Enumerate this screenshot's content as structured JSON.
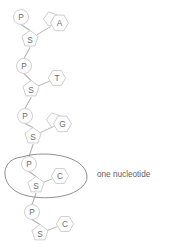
{
  "diagram": {
    "colors": {
      "background": "#ffffff",
      "shape_fill": "#fdfdfd",
      "shape_stroke": "#c9c9c9",
      "bond_stroke": "#b9b9b9",
      "backbone_stroke": "#b3b3b3",
      "outline_stroke": "#8f8f8f",
      "label_text": "#6f6f6f",
      "annotation_text": "#5f5f5f"
    },
    "annotation": {
      "text": "one nucleotide",
      "x": 97,
      "y": 174
    },
    "units": [
      {
        "index": 0,
        "phosphate": {
          "label": "P",
          "x": 21,
          "y": 17,
          "r": 7.5
        },
        "sugar": {
          "label": "S",
          "x": 30,
          "y": 39,
          "r": 8.5
        },
        "base": {
          "label": "A",
          "type": "purine",
          "x": 58,
          "y": 22,
          "r": 9.0
        }
      },
      {
        "index": 1,
        "phosphate": {
          "label": "P",
          "x": 24,
          "y": 66,
          "r": 7.5
        },
        "sugar": {
          "label": "S",
          "x": 31,
          "y": 89,
          "r": 8.5
        },
        "base": {
          "label": "T",
          "type": "pyrimidine",
          "x": 57,
          "y": 78,
          "r": 8.6
        }
      },
      {
        "index": 2,
        "phosphate": {
          "label": "P",
          "x": 25,
          "y": 116,
          "r": 7.5
        },
        "sugar": {
          "label": "S",
          "x": 33,
          "y": 136,
          "r": 8.5
        },
        "base": {
          "label": "G",
          "type": "purine",
          "x": 61,
          "y": 123,
          "r": 9.0
        }
      },
      {
        "index": 3,
        "highlighted": true,
        "phosphate": {
          "label": "P",
          "x": 29,
          "y": 164,
          "r": 7.5
        },
        "sugar": {
          "label": "S",
          "x": 36,
          "y": 185,
          "r": 8.5
        },
        "base": {
          "label": "C",
          "type": "pyrimidine",
          "x": 60,
          "y": 176,
          "r": 8.6
        }
      },
      {
        "index": 4,
        "phosphate": {
          "label": "P",
          "x": 32,
          "y": 212,
          "r": 7.5
        },
        "sugar": {
          "label": "S",
          "x": 40,
          "y": 233,
          "r": 8.5
        },
        "base": {
          "label": "C",
          "type": "pyrimidine",
          "x": 65,
          "y": 224,
          "r": 8.6
        }
      }
    ]
  }
}
